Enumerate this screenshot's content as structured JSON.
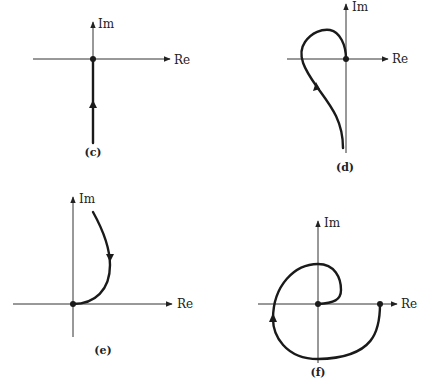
{
  "figure": {
    "panels": [
      {
        "id": "c",
        "caption": "(c)",
        "axes": {
          "x_label": "Re",
          "y_label": "Im"
        },
        "description": "Locus along negative imaginary axis moving upward to the origin"
      },
      {
        "id": "d",
        "caption": "(d)",
        "axes": {
          "x_label": "Re",
          "y_label": "Im"
        },
        "description": "Curve from lower region sweeping up through second quadrant, looping to the origin"
      },
      {
        "id": "e",
        "caption": "(e)",
        "axes": {
          "x_label": "Re",
          "y_label": "Im"
        },
        "description": "Curve in first quadrant descending to the origin"
      },
      {
        "id": "f",
        "caption": "(f)",
        "axes": {
          "x_label": "Re",
          "y_label": "Im"
        },
        "description": "Spiral starting on positive real axis, encircling origin clockwise, ending at origin"
      }
    ]
  }
}
